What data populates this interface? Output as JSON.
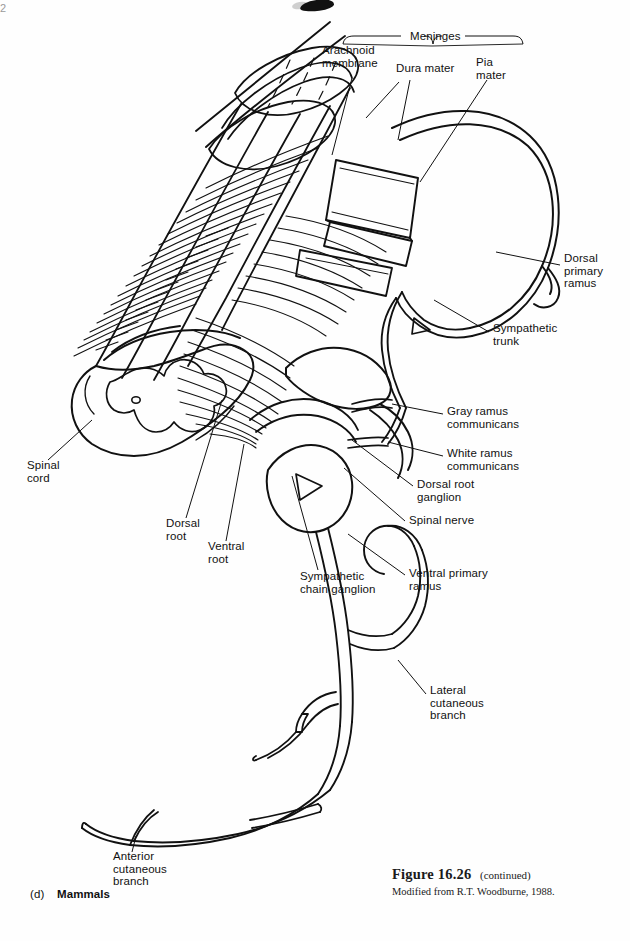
{
  "page": {
    "page_number": "2",
    "background": "#fefefe",
    "ink": "#111111"
  },
  "figure": {
    "caption_title": "Figure 16.26",
    "caption_continued": "(continued)",
    "caption_source": "Modified from R.T. Woodburne, 1988.",
    "panel_letter": "(d)",
    "panel_name": "Mammals"
  },
  "bracket": {
    "label": "Meninges"
  },
  "labels": [
    {
      "id": "arachnoid-membrane",
      "text": "Arachnoid\nmembrane",
      "x": 322,
      "y": 50,
      "align": "left"
    },
    {
      "id": "meninges",
      "text": "Meninges",
      "x": 410,
      "y": 36,
      "align": "left"
    },
    {
      "id": "dura-mater",
      "text": "Dura mater",
      "x": 396,
      "y": 68,
      "align": "left"
    },
    {
      "id": "pia-mater",
      "text": "Pia\nmater",
      "x": 476,
      "y": 62,
      "align": "left"
    },
    {
      "id": "dorsal-primary-ramus",
      "text": "Dorsal\nprimary\nramus",
      "x": 564,
      "y": 258,
      "align": "left"
    },
    {
      "id": "sympathetic-trunk",
      "text": "Sympathetic\ntrunk",
      "x": 493,
      "y": 328,
      "align": "left"
    },
    {
      "id": "gray-ramus-communicans",
      "text": "Gray ramus\ncommunicans",
      "x": 447,
      "y": 411,
      "align": "left"
    },
    {
      "id": "white-ramus-communicans",
      "text": "White ramus\ncommunicans",
      "x": 447,
      "y": 452,
      "align": "left"
    },
    {
      "id": "dorsal-root-ganglion",
      "text": "Dorsal root\nganglion",
      "x": 417,
      "y": 483,
      "align": "left"
    },
    {
      "id": "spinal-nerve",
      "text": "Spinal nerve",
      "x": 409,
      "y": 519,
      "align": "left"
    },
    {
      "id": "ventral-primary-ramus",
      "text": "Ventral primary\nramus",
      "x": 409,
      "y": 572,
      "align": "left"
    },
    {
      "id": "sympathetic-chain-ganglion",
      "text": "Sympathetic\nchain ganglion",
      "x": 300,
      "y": 575,
      "align": "left"
    },
    {
      "id": "ventral-root",
      "text": "Ventral\nroot",
      "x": 208,
      "y": 545,
      "align": "left"
    },
    {
      "id": "dorsal-root",
      "text": "Dorsal\nroot",
      "x": 166,
      "y": 522,
      "align": "left"
    },
    {
      "id": "spinal-cord",
      "text": "Spinal\ncord",
      "x": 27,
      "y": 464,
      "align": "left"
    },
    {
      "id": "lateral-cutaneous-branch",
      "text": "Lateral\ncutaneous\nbranch",
      "x": 430,
      "y": 690,
      "align": "left"
    },
    {
      "id": "anterior-cutaneous-branch",
      "text": "Anterior\ncutaneous\nbranch",
      "x": 113,
      "y": 855,
      "align": "left"
    }
  ],
  "anatomy": {
    "title": "Mammalian spinal cord segment with spinal nerve and sympathetic trunk",
    "parts": [
      "spinal-cord-cylinder",
      "spinal-cord-cross-section",
      "dorsal-rootlets",
      "ventral-rootlets",
      "dura-mater-sheath",
      "arachnoid-membrane-sheath",
      "pia-mater-layer",
      "dorsal-root-ganglion",
      "spinal-nerve-trunk",
      "dorsal-primary-ramus",
      "ventral-primary-ramus",
      "gray-ramus-communicans",
      "white-ramus-communicans",
      "sympathetic-trunk",
      "sympathetic-chain-ganglion",
      "lateral-cutaneous-branch",
      "anterior-cutaneous-branch"
    ]
  }
}
